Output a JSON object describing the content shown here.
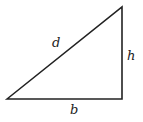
{
  "diagram": {
    "type": "right-triangle",
    "vertices": {
      "bottom_left": [
        7,
        99
      ],
      "top_right": [
        122,
        7
      ],
      "bottom_right": [
        122,
        99
      ]
    },
    "stroke_color": "#222222",
    "labels": {
      "hypotenuse": "d",
      "height": "h",
      "base": "b"
    }
  }
}
